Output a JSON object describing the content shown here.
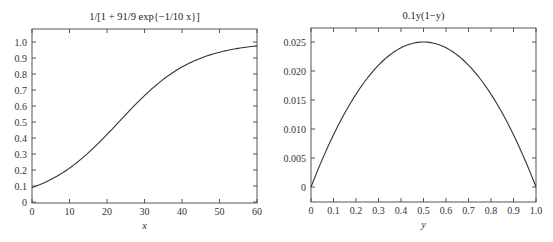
{
  "chart_data": [
    {
      "type": "line",
      "title": "1/[1 + 91/9 exp{−1/10 x}]",
      "xlabel": "x",
      "ylabel": "",
      "xlim": [
        0,
        60
      ],
      "ylim": [
        0,
        1.05
      ],
      "xticks": [
        "0",
        "10",
        "20",
        "30",
        "40",
        "50",
        "60"
      ],
      "yticks": [
        "0",
        "0.1",
        "0.2",
        "0.3",
        "0.4",
        "0.5",
        "0.6",
        "0.7",
        "0.8",
        "0.9",
        "1.0"
      ],
      "grid": false,
      "series": [
        {
          "name": "logistic",
          "x": [
            0,
            5,
            10,
            15,
            20,
            25,
            30,
            35,
            40,
            45,
            50,
            55,
            60
          ],
          "values": [
            0.09,
            0.14,
            0.212,
            0.307,
            0.422,
            0.546,
            0.665,
            0.766,
            0.844,
            0.899,
            0.936,
            0.96,
            0.976
          ]
        }
      ]
    },
    {
      "type": "line",
      "title": "0.1y(1−y)",
      "xlabel": "y",
      "ylabel": "",
      "xlim": [
        0,
        1.0
      ],
      "ylim": [
        -0.0025,
        0.027
      ],
      "xticks": [
        "0",
        "0.1",
        "0.2",
        "0.3",
        "0.4",
        "0.5",
        "0.6",
        "0.7",
        "0.8",
        "0.9",
        "1.0"
      ],
      "yticks": [
        "0",
        "0.005",
        "0.010",
        "0.015",
        "0.020",
        "0.025"
      ],
      "grid": false,
      "series": [
        {
          "name": "0.1y(1-y)",
          "x": [
            0,
            0.1,
            0.2,
            0.3,
            0.4,
            0.5,
            0.6,
            0.7,
            0.8,
            0.9,
            1.0
          ],
          "values": [
            0,
            0.009,
            0.016,
            0.021,
            0.024,
            0.025,
            0.024,
            0.021,
            0.016,
            0.009,
            0
          ]
        }
      ]
    }
  ]
}
